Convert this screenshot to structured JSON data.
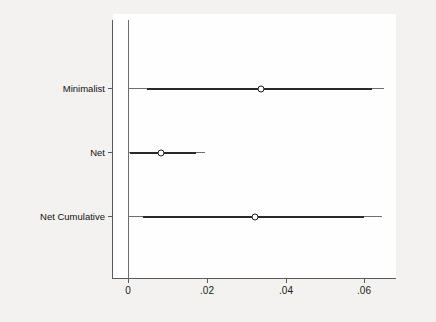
{
  "chart_data": {
    "type": "scatter",
    "subtype": "coefficient-plot-with-confidence-intervals",
    "title": "",
    "subtitle": "",
    "xlabel": "",
    "ylabel": "",
    "orientation": "horizontal",
    "grid": false,
    "legend": "none",
    "xlim": [
      -0.004,
      0.069
    ],
    "xticks": [
      0,
      0.02,
      0.04,
      0.06
    ],
    "xticklabels": [
      "0",
      ".02",
      ".04",
      ".06"
    ],
    "reference_line": 0,
    "categories": [
      "Minimalist",
      "Net",
      "Net Cumulative"
    ],
    "series": [
      {
        "name": "Point estimate",
        "values": [
          0.0339,
          0.0084,
          0.0322
        ]
      },
      {
        "name": "Inner confidence interval",
        "lower": [
          0.0048,
          0.0005,
          0.0038
        ],
        "upper": [
          0.062,
          0.0172,
          0.06
        ]
      },
      {
        "name": "Outer confidence interval",
        "lower": [
          0.0,
          0.0,
          0.0
        ],
        "upper": [
          0.0651,
          0.0195,
          0.0646
        ]
      }
    ],
    "points": [
      {
        "category": "Minimalist",
        "estimate": 0.0339,
        "inner_low": 0.0048,
        "inner_high": 0.062,
        "outer_low": 0.0,
        "outer_high": 0.0651
      },
      {
        "category": "Net",
        "estimate": 0.0084,
        "inner_low": 0.0005,
        "inner_high": 0.0172,
        "outer_low": 0.0,
        "outer_high": 0.0195
      },
      {
        "category": "Net Cumulative",
        "estimate": 0.0322,
        "inner_low": 0.0038,
        "inner_high": 0.06,
        "outer_low": 0.0,
        "outer_high": 0.0646
      }
    ],
    "colors": {
      "background": "#f3f2f0",
      "plot_background": "#fefefe",
      "axis": "#5a5a5a",
      "reference_line": "#6b6b6b",
      "inner_interval": "#2a2a2a",
      "outer_interval": "#6f6f6f",
      "marker_fill": "#ffffff",
      "marker_edge": "#1a1a1a",
      "text": "#111111"
    }
  },
  "axis": {
    "x": {
      "ticks": [
        {
          "value": 0,
          "label": "0"
        },
        {
          "value": 0.02,
          "label": ".02"
        },
        {
          "value": 0.04,
          "label": ".04"
        },
        {
          "value": 0.06,
          "label": ".06"
        }
      ]
    },
    "y": {
      "ticks": [
        {
          "label": "Minimalist"
        },
        {
          "label": "Net"
        },
        {
          "label": "Net Cumulative"
        }
      ]
    }
  }
}
